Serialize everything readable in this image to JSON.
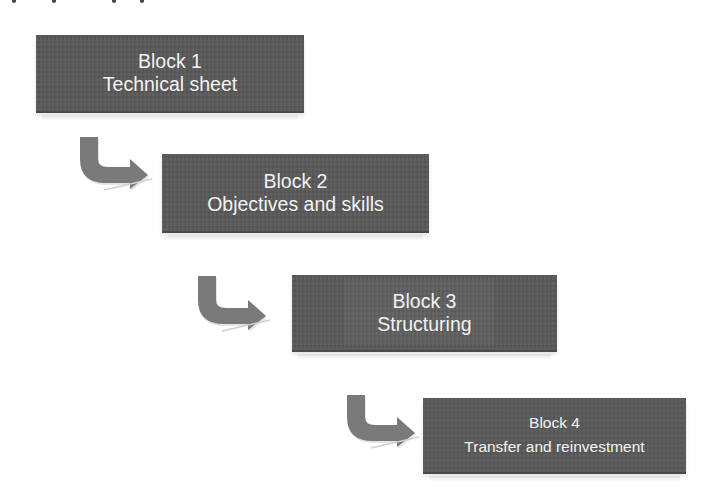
{
  "diagram": {
    "type": "stepped-flow",
    "colors": {
      "block_fill": "#595959",
      "block_text": "#f2f2f2",
      "arrow_fill": "#7a7a7a",
      "background": "#ffffff"
    },
    "blocks": [
      {
        "title": "Block 1",
        "subtitle": "Technical sheet"
      },
      {
        "title": "Block 2",
        "subtitle": "Objectives and skills"
      },
      {
        "title": "Block 3",
        "subtitle": "Structuring"
      },
      {
        "title": "Block 4",
        "subtitle": "Transfer and reinvestment"
      }
    ],
    "arrows": [
      {
        "from": "Block 1",
        "to": "Block 2",
        "icon": "curved-arrow-down-right-icon"
      },
      {
        "from": "Block 2",
        "to": "Block 3",
        "icon": "curved-arrow-down-right-icon"
      },
      {
        "from": "Block 3",
        "to": "Block 4",
        "icon": "curved-arrow-down-right-icon"
      }
    ]
  }
}
